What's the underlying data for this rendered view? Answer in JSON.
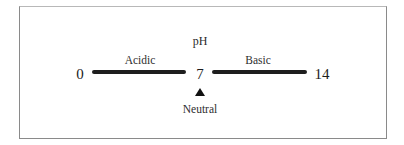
{
  "diagram": {
    "title": "pH",
    "scale": {
      "min": {
        "value": "0"
      },
      "mid": {
        "value": "7"
      },
      "max": {
        "value": "14"
      }
    },
    "regions": [
      {
        "label": "Acidic",
        "from": "0",
        "to": "7"
      },
      {
        "label": "Basic",
        "from": "7",
        "to": "14"
      }
    ],
    "marker": {
      "icon": "triangle-up-icon",
      "label": "Neutral",
      "at": "7"
    },
    "colors": {
      "bar": "#1e1e1e",
      "text": "#1a1a1a",
      "frame": "#8a8a8a",
      "background": "#ffffff"
    }
  }
}
